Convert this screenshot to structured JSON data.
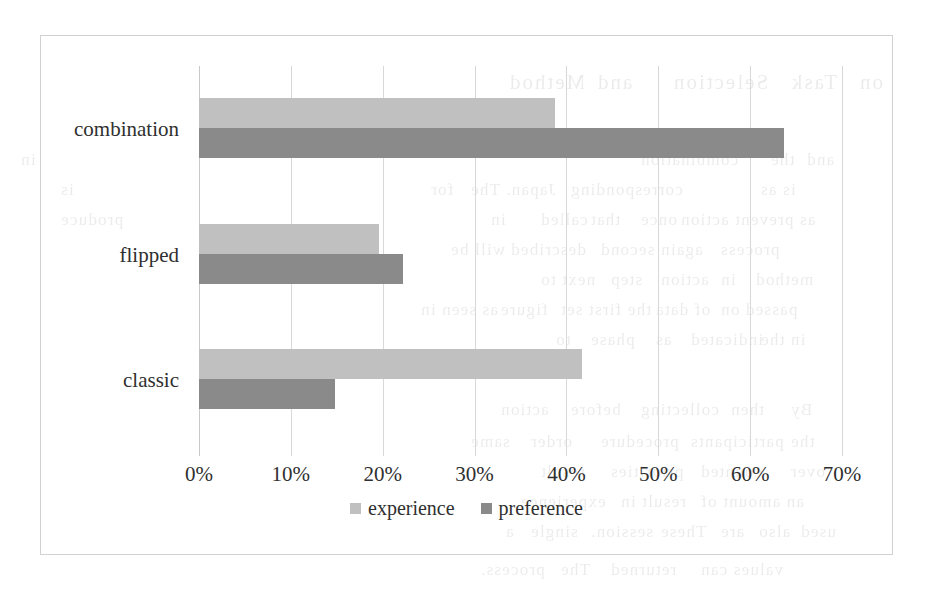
{
  "chart_data": {
    "type": "bar",
    "orientation": "horizontal",
    "title": "",
    "subtitle": "",
    "xlabel": "",
    "ylabel": "",
    "xlim": [
      0,
      70
    ],
    "xticks": [
      "0%",
      "10%",
      "20%",
      "30%",
      "40%",
      "50%",
      "60%",
      "70%"
    ],
    "xtick_values": [
      0,
      10,
      20,
      30,
      40,
      50,
      60,
      70
    ],
    "grid": "vertical",
    "legend_position": "bottom-center",
    "categories": [
      "classic",
      "flipped",
      "combination"
    ],
    "category_order_top_to_bottom": [
      "combination",
      "flipped",
      "classic"
    ],
    "series": [
      {
        "name": "experience",
        "color": "#c0c0c0",
        "values": [
          41.7,
          19.6,
          38.8
        ]
      },
      {
        "name": "preference",
        "color": "#8a8a8a",
        "values": [
          14.8,
          22.2,
          63.7
        ]
      }
    ],
    "legend": [
      {
        "label": "experience",
        "color": "#c0c0c0"
      },
      {
        "label": "preference",
        "color": "#8a8a8a"
      }
    ],
    "axis_unit": "percent"
  },
  "groups": [
    {
      "label": "combination",
      "experience": 38.8,
      "preference": 63.7
    },
    {
      "label": "flipped",
      "experience": 19.6,
      "preference": 22.2
    },
    {
      "label": "classic",
      "experience": 41.7,
      "preference": 14.8
    }
  ],
  "ticks": [
    {
      "label": "0%",
      "value": 0
    },
    {
      "label": "10%",
      "value": 10
    },
    {
      "label": "20%",
      "value": 20
    },
    {
      "label": "30%",
      "value": 30
    },
    {
      "label": "40%",
      "value": 40
    },
    {
      "label": "50%",
      "value": 50
    },
    {
      "label": "60%",
      "value": 60
    },
    {
      "label": "70%",
      "value": 70
    }
  ],
  "legend": {
    "entries": [
      {
        "label": "experience",
        "swatch": "experience-swatch"
      },
      {
        "label": "preference",
        "swatch": "preference-swatch"
      }
    ]
  },
  "colors": {
    "experience": "#c0c0c0",
    "preference": "#8a8a8a",
    "gridline": "#d8d8d8",
    "frame": "#d2d2d2",
    "text": "#2f2f2f",
    "background": "#ffffff"
  },
  "background_bleed": {
    "lines": [
      {
        "text": "Method",
        "x": 508,
        "y": 70,
        "heading": true
      },
      {
        "text": "and",
        "x": 596,
        "y": 70,
        "heading": true
      },
      {
        "text": "Selection",
        "x": 672,
        "y": 70,
        "heading": true
      },
      {
        "text": "Task",
        "x": 790,
        "y": 70,
        "heading": true
      },
      {
        "text": "on",
        "x": 858,
        "y": 70,
        "heading": true
      },
      {
        "text": "combination",
        "x": 640,
        "y": 150,
        "heading": false
      },
      {
        "text": "the",
        "x": 770,
        "y": 150,
        "heading": false
      },
      {
        "text": "and",
        "x": 806,
        "y": 150,
        "heading": false
      },
      {
        "text": "in",
        "x": 20,
        "y": 150,
        "heading": false
      },
      {
        "text": "is as",
        "x": 760,
        "y": 180,
        "heading": false
      },
      {
        "text": "corresponding",
        "x": 570,
        "y": 180,
        "heading": false
      },
      {
        "text": "Japan. The",
        "x": 470,
        "y": 180,
        "heading": false
      },
      {
        "text": "for",
        "x": 430,
        "y": 180,
        "heading": false
      },
      {
        "text": "is",
        "x": 60,
        "y": 180,
        "heading": false
      },
      {
        "text": "as prevent action",
        "x": 680,
        "y": 210,
        "heading": false
      },
      {
        "text": "once",
        "x": 640,
        "y": 210,
        "heading": false
      },
      {
        "text": "that",
        "x": 590,
        "y": 210,
        "heading": false
      },
      {
        "text": "called",
        "x": 540,
        "y": 210,
        "heading": false
      },
      {
        "text": "in",
        "x": 490,
        "y": 210,
        "heading": false
      },
      {
        "text": "produce",
        "x": 60,
        "y": 210,
        "heading": false
      },
      {
        "text": "process",
        "x": 720,
        "y": 240,
        "heading": false
      },
      {
        "text": "again",
        "x": 660,
        "y": 240,
        "heading": false
      },
      {
        "text": "second",
        "x": 600,
        "y": 240,
        "heading": false
      },
      {
        "text": "described",
        "x": 510,
        "y": 240,
        "heading": false
      },
      {
        "text": "will be",
        "x": 450,
        "y": 240,
        "heading": false
      },
      {
        "text": "method",
        "x": 755,
        "y": 270,
        "heading": false
      },
      {
        "text": "in",
        "x": 720,
        "y": 270,
        "heading": false
      },
      {
        "text": "action",
        "x": 660,
        "y": 270,
        "heading": false
      },
      {
        "text": "step",
        "x": 610,
        "y": 270,
        "heading": false
      },
      {
        "text": "next to",
        "x": 540,
        "y": 270,
        "heading": false
      },
      {
        "text": "passed on",
        "x": 720,
        "y": 300,
        "heading": false
      },
      {
        "text": "of data",
        "x": 655,
        "y": 300,
        "heading": false
      },
      {
        "text": "the first set",
        "x": 560,
        "y": 300,
        "heading": false
      },
      {
        "text": "figure",
        "x": 500,
        "y": 300,
        "heading": false
      },
      {
        "text": "as seen in",
        "x": 420,
        "y": 300,
        "heading": false
      },
      {
        "text": "in the",
        "x": 760,
        "y": 330,
        "heading": false
      },
      {
        "text": "indicated",
        "x": 690,
        "y": 330,
        "heading": false
      },
      {
        "text": "as",
        "x": 655,
        "y": 330,
        "heading": false
      },
      {
        "text": "phase",
        "x": 590,
        "y": 330,
        "heading": false
      },
      {
        "text": "to",
        "x": 555,
        "y": 330,
        "heading": false
      },
      {
        "text": "By",
        "x": 790,
        "y": 400,
        "heading": false
      },
      {
        "text": "then",
        "x": 730,
        "y": 400,
        "heading": false
      },
      {
        "text": "collecting",
        "x": 640,
        "y": 400,
        "heading": false
      },
      {
        "text": "before",
        "x": 570,
        "y": 400,
        "heading": false
      },
      {
        "text": "action",
        "x": 500,
        "y": 400,
        "heading": false
      },
      {
        "text": "the",
        "x": 790,
        "y": 432,
        "heading": false
      },
      {
        "text": "participants",
        "x": 690,
        "y": 432,
        "heading": false
      },
      {
        "text": "procedure",
        "x": 600,
        "y": 432,
        "heading": false
      },
      {
        "text": "order",
        "x": 530,
        "y": 432,
        "heading": false
      },
      {
        "text": "same",
        "x": 470,
        "y": 432,
        "heading": false
      },
      {
        "text": "over",
        "x": 790,
        "y": 462,
        "heading": false
      },
      {
        "text": "counted",
        "x": 700,
        "y": 462,
        "heading": false
      },
      {
        "text": "priorities",
        "x": 610,
        "y": 462,
        "heading": false
      },
      {
        "text": "result",
        "x": 540,
        "y": 462,
        "heading": false
      },
      {
        "text": "an amount of",
        "x": 700,
        "y": 492,
        "heading": false
      },
      {
        "text": "result in",
        "x": 620,
        "y": 492,
        "heading": false
      },
      {
        "text": "experience",
        "x": 520,
        "y": 492,
        "heading": false
      },
      {
        "text": "used",
        "x": 800,
        "y": 522,
        "heading": false
      },
      {
        "text": "also",
        "x": 758,
        "y": 522,
        "heading": false
      },
      {
        "text": "are",
        "x": 720,
        "y": 522,
        "heading": false
      },
      {
        "text": "These",
        "x": 660,
        "y": 522,
        "heading": false
      },
      {
        "text": "session.",
        "x": 590,
        "y": 522,
        "heading": false
      },
      {
        "text": "single",
        "x": 530,
        "y": 522,
        "heading": false
      },
      {
        "text": "a",
        "x": 505,
        "y": 522,
        "heading": false
      },
      {
        "text": "values can",
        "x": 700,
        "y": 560,
        "heading": false
      },
      {
        "text": "returned",
        "x": 610,
        "y": 560,
        "heading": false
      },
      {
        "text": "The",
        "x": 560,
        "y": 560,
        "heading": false
      },
      {
        "text": "process.",
        "x": 480,
        "y": 560,
        "heading": false
      }
    ]
  }
}
